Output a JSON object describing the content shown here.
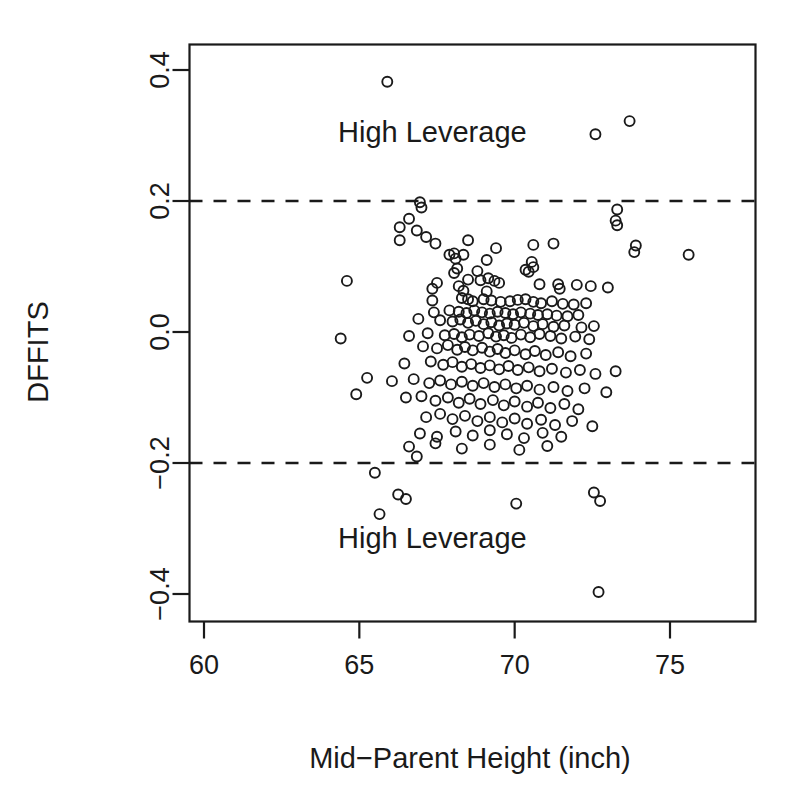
{
  "chart_data": {
    "type": "scatter",
    "title": "",
    "xlabel": "Mid−Parent Height (inch)",
    "ylabel": "DFFITS",
    "xlim": [
      58.3,
      76.8
    ],
    "ylim": [
      -0.44,
      0.44
    ],
    "xticks": [
      60,
      65,
      70,
      75
    ],
    "xtick_labels": [
      "60",
      "65",
      "70",
      "75"
    ],
    "yticks": [
      -0.4,
      -0.2,
      0.0,
      0.2,
      0.4
    ],
    "ytick_labels": [
      "-0.4",
      "-0.2",
      "0.0",
      "0.2",
      "0.4"
    ],
    "grid": false,
    "legend": null,
    "marker": "open-circle",
    "marker_color": "#1a1a1a",
    "background": "#ffffff",
    "reference_lines": [
      {
        "type": "horizontal",
        "value": 0.2,
        "style": "dashed",
        "color": "#1a1a1a"
      },
      {
        "type": "horizontal",
        "value": -0.2,
        "style": "dashed",
        "color": "#1a1a1a"
      }
    ],
    "annotations": [
      {
        "text": "High Leverage",
        "x": 67.35,
        "y": 0.305
      },
      {
        "text": "High Leverage",
        "x": 67.35,
        "y": -0.315
      }
    ],
    "points": [
      [
        65.9,
        0.382
      ],
      [
        73.7,
        0.322
      ],
      [
        72.6,
        0.302
      ],
      [
        66.3,
        0.16
      ],
      [
        73.3,
        0.187
      ],
      [
        66.95,
        0.198
      ],
      [
        67.0,
        0.19
      ],
      [
        73.25,
        0.17
      ],
      [
        73.3,
        0.163
      ],
      [
        66.6,
        0.173
      ],
      [
        66.85,
        0.155
      ],
      [
        66.3,
        0.14
      ],
      [
        67.15,
        0.145
      ],
      [
        67.45,
        0.135
      ],
      [
        73.9,
        0.132
      ],
      [
        73.85,
        0.122
      ],
      [
        75.6,
        0.118
      ],
      [
        68.5,
        0.14
      ],
      [
        69.4,
        0.128
      ],
      [
        70.6,
        0.133
      ],
      [
        71.25,
        0.135
      ],
      [
        68.05,
        0.12
      ],
      [
        68.1,
        0.112
      ],
      [
        67.9,
        0.118
      ],
      [
        68.35,
        0.118
      ],
      [
        69.1,
        0.11
      ],
      [
        70.55,
        0.107
      ],
      [
        70.6,
        0.099
      ],
      [
        68.15,
        0.097
      ],
      [
        68.8,
        0.093
      ],
      [
        68.05,
        0.09
      ],
      [
        70.35,
        0.095
      ],
      [
        70.45,
        0.092
      ],
      [
        64.6,
        0.078
      ],
      [
        67.5,
        0.075
      ],
      [
        68.5,
        0.08
      ],
      [
        68.9,
        0.079
      ],
      [
        69.15,
        0.082
      ],
      [
        69.35,
        0.078
      ],
      [
        69.5,
        0.075
      ],
      [
        67.35,
        0.066
      ],
      [
        68.2,
        0.07
      ],
      [
        68.35,
        0.063
      ],
      [
        69.1,
        0.062
      ],
      [
        70.8,
        0.073
      ],
      [
        71.4,
        0.073
      ],
      [
        71.45,
        0.066
      ],
      [
        72.0,
        0.072
      ],
      [
        72.45,
        0.07
      ],
      [
        73.0,
        0.068
      ],
      [
        67.35,
        0.048
      ],
      [
        68.3,
        0.052
      ],
      [
        68.5,
        0.05
      ],
      [
        68.65,
        0.047
      ],
      [
        69.0,
        0.05
      ],
      [
        69.25,
        0.048
      ],
      [
        69.55,
        0.046
      ],
      [
        69.85,
        0.047
      ],
      [
        70.1,
        0.049
      ],
      [
        70.35,
        0.05
      ],
      [
        70.6,
        0.046
      ],
      [
        70.85,
        0.044
      ],
      [
        71.2,
        0.047
      ],
      [
        71.55,
        0.043
      ],
      [
        71.9,
        0.042
      ],
      [
        72.3,
        0.044
      ],
      [
        67.4,
        0.03
      ],
      [
        67.9,
        0.033
      ],
      [
        68.2,
        0.031
      ],
      [
        68.45,
        0.029
      ],
      [
        68.7,
        0.033
      ],
      [
        68.95,
        0.03
      ],
      [
        69.2,
        0.028
      ],
      [
        69.45,
        0.031
      ],
      [
        69.7,
        0.029
      ],
      [
        69.95,
        0.027
      ],
      [
        70.2,
        0.03
      ],
      [
        70.5,
        0.028
      ],
      [
        70.75,
        0.026
      ],
      [
        71.05,
        0.027
      ],
      [
        71.35,
        0.025
      ],
      [
        71.7,
        0.024
      ],
      [
        72.05,
        0.026
      ],
      [
        66.9,
        0.02
      ],
      [
        67.6,
        0.018
      ],
      [
        68.0,
        0.016
      ],
      [
        68.25,
        0.019
      ],
      [
        68.5,
        0.014
      ],
      [
        68.75,
        0.017
      ],
      [
        69.0,
        0.012
      ],
      [
        69.25,
        0.015
      ],
      [
        69.5,
        0.01
      ],
      [
        69.75,
        0.013
      ],
      [
        70.0,
        0.011
      ],
      [
        70.3,
        0.014
      ],
      [
        70.6,
        0.009
      ],
      [
        70.9,
        0.012
      ],
      [
        71.25,
        0.008
      ],
      [
        71.6,
        0.01
      ],
      [
        72.15,
        0.007
      ],
      [
        72.55,
        0.009
      ],
      [
        64.4,
        -0.01
      ],
      [
        66.6,
        -0.006
      ],
      [
        67.2,
        -0.002
      ],
      [
        67.75,
        -0.005
      ],
      [
        68.05,
        -0.003
      ],
      [
        68.3,
        -0.008
      ],
      [
        68.55,
        -0.004
      ],
      [
        68.85,
        -0.006
      ],
      [
        69.15,
        -0.002
      ],
      [
        69.4,
        -0.007
      ],
      [
        69.65,
        -0.005
      ],
      [
        69.9,
        -0.009
      ],
      [
        70.2,
        -0.004
      ],
      [
        70.5,
        -0.008
      ],
      [
        70.8,
        -0.003
      ],
      [
        71.15,
        -0.006
      ],
      [
        71.5,
        -0.01
      ],
      [
        71.95,
        -0.007
      ],
      [
        72.4,
        -0.011
      ],
      [
        67.05,
        -0.022
      ],
      [
        67.5,
        -0.025
      ],
      [
        67.85,
        -0.02
      ],
      [
        68.15,
        -0.027
      ],
      [
        68.4,
        -0.023
      ],
      [
        68.65,
        -0.028
      ],
      [
        68.95,
        -0.024
      ],
      [
        69.2,
        -0.03
      ],
      [
        69.45,
        -0.026
      ],
      [
        69.7,
        -0.032
      ],
      [
        70.0,
        -0.028
      ],
      [
        70.35,
        -0.034
      ],
      [
        70.65,
        -0.029
      ],
      [
        71.0,
        -0.035
      ],
      [
        71.4,
        -0.031
      ],
      [
        71.8,
        -0.037
      ],
      [
        72.3,
        -0.033
      ],
      [
        66.45,
        -0.048
      ],
      [
        67.3,
        -0.045
      ],
      [
        67.7,
        -0.05
      ],
      [
        68.0,
        -0.046
      ],
      [
        68.3,
        -0.053
      ],
      [
        68.6,
        -0.049
      ],
      [
        68.9,
        -0.055
      ],
      [
        69.2,
        -0.051
      ],
      [
        69.5,
        -0.057
      ],
      [
        69.8,
        -0.052
      ],
      [
        70.1,
        -0.058
      ],
      [
        70.45,
        -0.054
      ],
      [
        70.8,
        -0.06
      ],
      [
        71.2,
        -0.056
      ],
      [
        71.65,
        -0.062
      ],
      [
        72.1,
        -0.058
      ],
      [
        72.6,
        -0.064
      ],
      [
        73.25,
        -0.06
      ],
      [
        65.25,
        -0.07
      ],
      [
        66.05,
        -0.075
      ],
      [
        66.75,
        -0.072
      ],
      [
        67.25,
        -0.078
      ],
      [
        67.6,
        -0.074
      ],
      [
        67.95,
        -0.08
      ],
      [
        68.3,
        -0.076
      ],
      [
        68.65,
        -0.082
      ],
      [
        69.0,
        -0.078
      ],
      [
        69.35,
        -0.084
      ],
      [
        69.7,
        -0.08
      ],
      [
        70.05,
        -0.086
      ],
      [
        70.4,
        -0.082
      ],
      [
        70.8,
        -0.088
      ],
      [
        71.25,
        -0.084
      ],
      [
        71.7,
        -0.09
      ],
      [
        72.25,
        -0.086
      ],
      [
        72.95,
        -0.092
      ],
      [
        64.9,
        -0.095
      ],
      [
        66.5,
        -0.1
      ],
      [
        67.0,
        -0.098
      ],
      [
        67.45,
        -0.105
      ],
      [
        67.85,
        -0.1
      ],
      [
        68.2,
        -0.108
      ],
      [
        68.55,
        -0.102
      ],
      [
        68.9,
        -0.11
      ],
      [
        69.3,
        -0.104
      ],
      [
        69.65,
        -0.112
      ],
      [
        70.0,
        -0.106
      ],
      [
        70.4,
        -0.114
      ],
      [
        70.75,
        -0.108
      ],
      [
        71.15,
        -0.116
      ],
      [
        71.6,
        -0.11
      ],
      [
        72.05,
        -0.118
      ],
      [
        67.15,
        -0.13
      ],
      [
        67.6,
        -0.125
      ],
      [
        68.0,
        -0.133
      ],
      [
        68.4,
        -0.128
      ],
      [
        68.8,
        -0.136
      ],
      [
        69.2,
        -0.13
      ],
      [
        69.6,
        -0.138
      ],
      [
        70.0,
        -0.132
      ],
      [
        70.4,
        -0.14
      ],
      [
        70.85,
        -0.134
      ],
      [
        71.3,
        -0.142
      ],
      [
        71.85,
        -0.136
      ],
      [
        72.5,
        -0.144
      ],
      [
        66.95,
        -0.155
      ],
      [
        67.5,
        -0.16
      ],
      [
        68.1,
        -0.152
      ],
      [
        68.65,
        -0.158
      ],
      [
        69.2,
        -0.15
      ],
      [
        69.75,
        -0.156
      ],
      [
        70.3,
        -0.162
      ],
      [
        70.9,
        -0.154
      ],
      [
        71.5,
        -0.16
      ],
      [
        66.6,
        -0.175
      ],
      [
        67.45,
        -0.17
      ],
      [
        68.3,
        -0.178
      ],
      [
        69.2,
        -0.172
      ],
      [
        70.15,
        -0.18
      ],
      [
        71.05,
        -0.174
      ],
      [
        66.85,
        -0.19
      ],
      [
        65.5,
        -0.215
      ],
      [
        66.25,
        -0.248
      ],
      [
        66.5,
        -0.255
      ],
      [
        65.65,
        -0.278
      ],
      [
        70.05,
        -0.262
      ],
      [
        72.55,
        -0.245
      ],
      [
        72.75,
        -0.258
      ],
      [
        72.7,
        -0.397
      ]
    ]
  }
}
